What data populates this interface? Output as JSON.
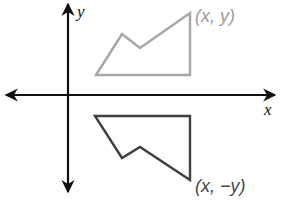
{
  "diagram": {
    "axes": {
      "x_label": "x",
      "y_label": "y",
      "color": "#111111",
      "origin_px": [
        68,
        95
      ]
    },
    "shapes": [
      {
        "name": "original",
        "color": "#a6a6a6",
        "vertices_px": [
          [
            96,
            75
          ],
          [
            122,
            34
          ],
          [
            140,
            48
          ],
          [
            190,
            13
          ],
          [
            190,
            75
          ]
        ],
        "label": "(x, y)",
        "label_color": "#9a9a9a"
      },
      {
        "name": "reflection",
        "color": "#3f3f3f",
        "vertices_px": [
          [
            95,
            116
          ],
          [
            190,
            116
          ],
          [
            190,
            180
          ],
          [
            140,
            147
          ],
          [
            122,
            158
          ]
        ],
        "label": "(x, −y)",
        "label_color": "#444444"
      }
    ]
  }
}
